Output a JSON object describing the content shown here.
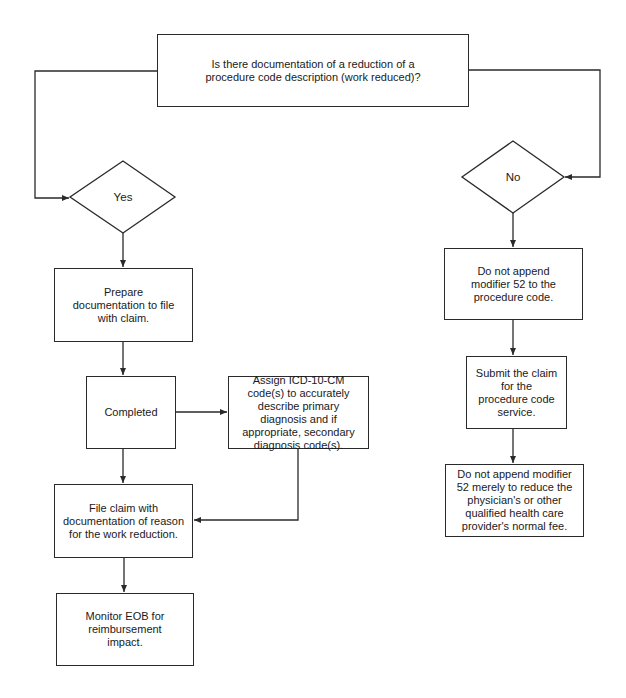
{
  "diagram": {
    "type": "flowchart",
    "question": "Is there documentation of a reduction of a procedure code description (work reduced)?",
    "branches": {
      "yes": {
        "label": "Yes",
        "steps": {
          "prepare": "Prepare documentation to file with claim.",
          "completed": "Completed",
          "assign": "Assign ICD-10-CM code(s) to accurately describe primary diagnosis and if appropriate, secondary diagnosis code(s).",
          "file_claim": "File claim with documentation of reason for the work reduction.",
          "monitor": "Monitor EOB for reimbursement impact."
        }
      },
      "no": {
        "label": "No",
        "steps": {
          "no_modifier": "Do not append modifier 52 to the procedure code.",
          "submit": "Submit the claim for the procedure code service.",
          "no_reduce_fee": "Do not append modifier 52 merely to reduce the physician's or other qualified health care provider's normal fee."
        }
      }
    },
    "edges": [
      {
        "from": "question",
        "to": "yes"
      },
      {
        "from": "question",
        "to": "no"
      },
      {
        "from": "yes",
        "to": "prepare"
      },
      {
        "from": "prepare",
        "to": "completed"
      },
      {
        "from": "completed",
        "to": "assign"
      },
      {
        "from": "completed",
        "to": "file_claim"
      },
      {
        "from": "assign",
        "to": "file_claim"
      },
      {
        "from": "file_claim",
        "to": "monitor"
      },
      {
        "from": "no",
        "to": "no_modifier"
      },
      {
        "from": "no_modifier",
        "to": "submit"
      },
      {
        "from": "submit",
        "to": "no_reduce_fee"
      }
    ],
    "colors": {
      "stroke": "#2a2a2a",
      "background": "#ffffff",
      "text": "#1a1a1a"
    }
  }
}
